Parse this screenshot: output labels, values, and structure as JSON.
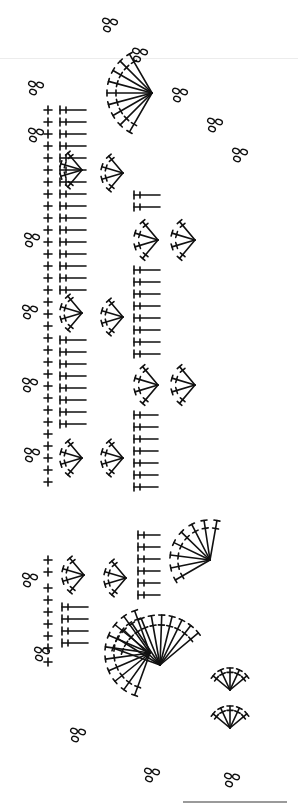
{
  "diagram": {
    "type": "crochet-chart",
    "ink_color": "#111111",
    "background": "#ffffff",
    "legend": {
      "sc": "single crochet (+ / x)",
      "ch": "chain (oval)",
      "dc": "double crochet (T with 1 bar)",
      "tr": "treble crochet (T with 2 bars)"
    },
    "sections": [
      {
        "name": "upper-edging-strip",
        "y_range": [
          20,
          500
        ]
      },
      {
        "name": "lower-corner-motif",
        "y_range": [
          520,
          800
        ]
      }
    ],
    "sc_column_x": 48,
    "sc_column": {
      "upper": [
        110,
        122,
        134,
        146,
        158,
        170,
        182,
        194,
        206,
        218,
        230,
        242,
        254,
        266,
        278,
        290,
        302,
        314,
        326,
        338,
        350,
        362,
        374,
        386,
        398,
        410,
        422,
        434,
        446,
        458,
        470,
        482
      ],
      "lower": [
        560,
        572,
        588,
        600,
        612,
        624,
        636,
        648,
        662
      ]
    },
    "chain_clusters": [
      {
        "x": 36,
        "y": 88
      },
      {
        "x": 36,
        "y": 135
      },
      {
        "x": 32,
        "y": 240
      },
      {
        "x": 30,
        "y": 312
      },
      {
        "x": 30,
        "y": 385
      },
      {
        "x": 32,
        "y": 455
      },
      {
        "x": 30,
        "y": 580
      },
      {
        "x": 42,
        "y": 654
      },
      {
        "x": 78,
        "y": 735
      },
      {
        "x": 152,
        "y": 775
      },
      {
        "x": 232,
        "y": 780
      },
      {
        "x": 110,
        "y": 25
      },
      {
        "x": 140,
        "y": 55
      },
      {
        "x": 180,
        "y": 95
      },
      {
        "x": 215,
        "y": 125
      },
      {
        "x": 240,
        "y": 155
      }
    ],
    "fans": [
      {
        "cx": 152,
        "cy": 93,
        "r": 45,
        "from": 120,
        "to": 240,
        "n": 9
      },
      {
        "cx": 82,
        "cy": 170,
        "r": 22,
        "from": 130,
        "to": 230,
        "n": 4
      },
      {
        "cx": 123,
        "cy": 173,
        "r": 22,
        "from": 130,
        "to": 230,
        "n": 4
      },
      {
        "cx": 82,
        "cy": 313,
        "r": 22,
        "from": 130,
        "to": 230,
        "n": 4
      },
      {
        "cx": 123,
        "cy": 317,
        "r": 22,
        "from": 130,
        "to": 230,
        "n": 4
      },
      {
        "cx": 82,
        "cy": 458,
        "r": 22,
        "from": 130,
        "to": 230,
        "n": 4
      },
      {
        "cx": 123,
        "cy": 458,
        "r": 22,
        "from": 130,
        "to": 230,
        "n": 4
      },
      {
        "cx": 158,
        "cy": 240,
        "r": 24,
        "from": 130,
        "to": 230,
        "n": 4
      },
      {
        "cx": 195,
        "cy": 240,
        "r": 24,
        "from": 130,
        "to": 230,
        "n": 4
      },
      {
        "cx": 158,
        "cy": 385,
        "r": 24,
        "from": 130,
        "to": 230,
        "n": 4
      },
      {
        "cx": 195,
        "cy": 385,
        "r": 24,
        "from": 130,
        "to": 230,
        "n": 4
      },
      {
        "cx": 84,
        "cy": 575,
        "r": 22,
        "from": 130,
        "to": 230,
        "n": 4
      },
      {
        "cx": 126,
        "cy": 578,
        "r": 22,
        "from": 130,
        "to": 230,
        "n": 4
      },
      {
        "cx": 150,
        "cy": 653,
        "r": 45,
        "from": 110,
        "to": 250,
        "n": 10
      },
      {
        "cx": 160,
        "cy": 665,
        "r": 50,
        "from": 200,
        "to": 320,
        "n": 11
      },
      {
        "cx": 230,
        "cy": 690,
        "r": 22,
        "from": 220,
        "to": 320,
        "n": 5
      },
      {
        "cx": 230,
        "cy": 728,
        "r": 22,
        "from": 220,
        "to": 320,
        "n": 5
      },
      {
        "cx": 210,
        "cy": 560,
        "r": 40,
        "from": 150,
        "to": 280,
        "n": 8
      }
    ],
    "dc_rows": [
      {
        "x": 60,
        "y_start": 110,
        "y_end": 290,
        "step": 12,
        "len": 26
      },
      {
        "x": 60,
        "y_start": 340,
        "y_end": 430,
        "step": 12,
        "len": 26
      },
      {
        "x": 134,
        "y_start": 195,
        "y_end": 215,
        "step": 12,
        "len": 26
      },
      {
        "x": 134,
        "y_start": 270,
        "y_end": 355,
        "step": 12,
        "len": 26
      },
      {
        "x": 134,
        "y_start": 415,
        "y_end": 495,
        "step": 12,
        "len": 24
      },
      {
        "x": 138,
        "y_start": 535,
        "y_end": 600,
        "step": 12,
        "len": 22
      },
      {
        "x": 62,
        "y_start": 607,
        "y_end": 645,
        "step": 12,
        "len": 26
      }
    ],
    "bottom_rule": {
      "x": 183,
      "y": 801,
      "width": 104,
      "color": "#9a9a9a"
    }
  }
}
